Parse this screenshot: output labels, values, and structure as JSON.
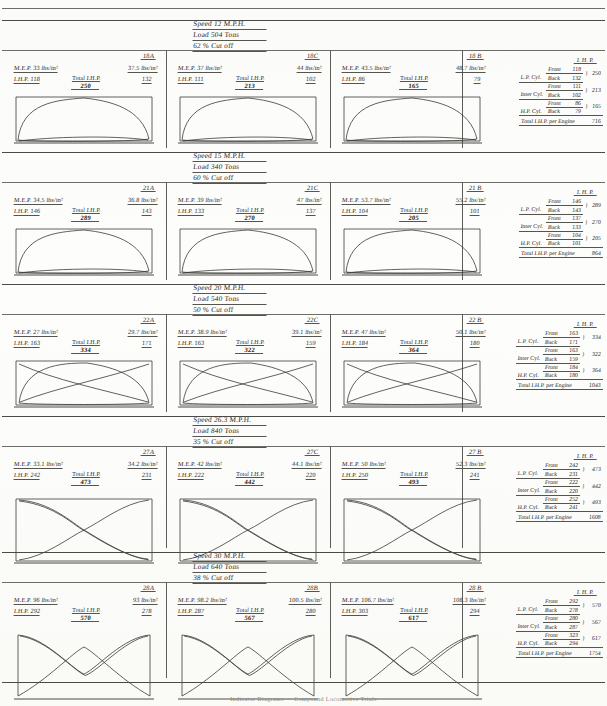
{
  "document": {
    "caption": "Indicator Diagrams — Compound Locomotive Trials",
    "ihp_header": "I. H. P.",
    "labels": {
      "mep": "M.E.P.",
      "ihp": "I.H.P.",
      "total_ihp": "Total I.H.P.",
      "front": "Front",
      "back": "Back",
      "total_per_engine": "Total I.H.P. per Engine",
      "lp_cyl": "L.P. Cyl.",
      "inter_cyl": "Inter Cyl.",
      "hp_cyl": "H.P. Cyl.",
      "units": "lbs/in²"
    },
    "colors": {
      "ink": "#2a2a28",
      "rule": "#55554f",
      "paper": "#fdfdfb"
    }
  },
  "sections": [
    {
      "id": "run-18",
      "speed": "Speed  12 M.P.H.",
      "load": "Load  504 Tons",
      "cutoff": "62 % Cut off",
      "panels": [
        {
          "fig": "18A",
          "mep_left": "M.E.P.  33 lbs/in²",
          "mep_right": "37.5 lbs/in²",
          "ihp_left": "I.H.P.  118",
          "ihp_right": "132",
          "total_ihp": "250",
          "shape": "loop"
        },
        {
          "fig": "18C",
          "mep_left": "M.E.P.  37 lbs/in²",
          "mep_right": "44 lbs/in²",
          "ihp_left": "I.H.P.  111",
          "ihp_right": "102",
          "total_ihp": "213",
          "shape": "loop"
        },
        {
          "fig": "18 B",
          "mep_left": "M.E.P.  43.5 lbs/in²",
          "mep_right": "48.7 lbs/in²",
          "ihp_left": "I.H.P.  86",
          "ihp_right": "79",
          "total_ihp": "165",
          "shape": "loop"
        }
      ],
      "table": {
        "rows": [
          {
            "cyl": "L.P. Cyl.",
            "front_label": "Front",
            "front": "118",
            "back_label": "Back",
            "back": "132",
            "total": "250"
          },
          {
            "cyl": "Inter Cyl.",
            "front_label": "Front",
            "front": "111",
            "back_label": "Back",
            "back": "102",
            "total": "213"
          },
          {
            "cyl": "H.P. Cyl.",
            "front_label": "Front",
            "front": "86",
            "back_label": "Back",
            "back": "79",
            "total": "165"
          }
        ],
        "total_label": "Total I.H.P. per Engine",
        "total_value": "716"
      }
    },
    {
      "id": "run-21",
      "speed": "Speed  15 M.P.H.",
      "load": "Load  340 Tons",
      "cutoff": "60 % Cut off",
      "panels": [
        {
          "fig": "21A",
          "mep_left": "M.E.P.  34.5 lbs/in²",
          "mep_right": "36.8 lbs/in²",
          "ihp_left": "I.H.P.  146",
          "ihp_right": "143",
          "total_ihp": "289",
          "shape": "loop"
        },
        {
          "fig": "21C",
          "mep_left": "M.E.P.  39 lbs/in²",
          "mep_right": "47 lbs/in²",
          "ihp_left": "I.H.P.  133",
          "ihp_right": "137",
          "total_ihp": "270",
          "shape": "loop"
        },
        {
          "fig": "21 B",
          "mep_left": "M.E.P.  53.7 lbs/in²",
          "mep_right": "55.2 lbs/in²",
          "ihp_left": "I.H.P.  104",
          "ihp_right": "101",
          "total_ihp": "205",
          "shape": "loop"
        }
      ],
      "table": {
        "rows": [
          {
            "cyl": "L.P. Cyl.",
            "front_label": "Front",
            "front": "146",
            "back_label": "Back",
            "back": "143",
            "total": "289"
          },
          {
            "cyl": "Inter Cyl.",
            "front_label": "Front",
            "front": "137",
            "back_label": "Back",
            "back": "133",
            "total": "270"
          },
          {
            "cyl": "H.P. Cyl.",
            "front_label": "Front",
            "front": "104",
            "back_label": "Back",
            "back": "101",
            "total": "205"
          }
        ],
        "total_label": "Total I.H.P. per Engine",
        "total_value": "864"
      }
    },
    {
      "id": "run-22",
      "speed": "Speed  20 M.P.H.",
      "load": "Load  540 Tons",
      "cutoff": "50 % Cut off",
      "panels": [
        {
          "fig": "22A",
          "mep_left": "M.E.P.  27 lbs/in²",
          "mep_right": "29.7 lbs/in²",
          "ihp_left": "I.H.P.  163",
          "ihp_right": "171",
          "total_ihp": "334",
          "shape": "cross"
        },
        {
          "fig": "22C",
          "mep_left": "M.E.P.  38.9 lbs/in²",
          "mep_right": "39.1 lbs/in²",
          "ihp_left": "I.H.P.  163",
          "ihp_right": "159",
          "total_ihp": "322",
          "shape": "cross"
        },
        {
          "fig": "22 B",
          "mep_left": "M.E.P.  47 lbs/in²",
          "mep_right": "50.1 lbs/in²",
          "ihp_left": "I.H.P.  184",
          "ihp_right": "180",
          "total_ihp": "364",
          "shape": "cross"
        }
      ],
      "table": {
        "rows": [
          {
            "cyl": "L.P. Cyl.",
            "front_label": "Front",
            "front": "163",
            "back_label": "Back",
            "back": "171",
            "total": "334"
          },
          {
            "cyl": "Inter Cyl.",
            "front_label": "Front",
            "front": "163",
            "back_label": "Back",
            "back": "159",
            "total": "322"
          },
          {
            "cyl": "H.P. Cyl.",
            "front_label": "Front",
            "front": "184",
            "back_label": "Back",
            "back": "180",
            "total": "364"
          }
        ],
        "total_label": "Total I.H.P. per Engine",
        "total_value": "1043"
      }
    },
    {
      "id": "run-27",
      "speed": "Speed  26.3 M.P.H.",
      "load": "Load  840 Tons",
      "cutoff": "35 % Cut off",
      "panels": [
        {
          "fig": "27A",
          "mep_left": "M.E.P.  33.1 lbs/in²",
          "mep_right": "34.2 lbs/in²",
          "ihp_left": "I.H.P.  242",
          "ihp_right": "231",
          "total_ihp": "473",
          "shape": "bowtie"
        },
        {
          "fig": "27C",
          "mep_left": "M.E.P.  42 lbs/in²",
          "mep_right": "44.1 lbs/in²",
          "ihp_left": "I.H.P.  222",
          "ihp_right": "220",
          "total_ihp": "442",
          "shape": "bowtie"
        },
        {
          "fig": "27 B",
          "mep_left": "M.E.P.  50 lbs/in²",
          "mep_right": "52.3 lbs/in²",
          "ihp_left": "I.H.P.  250",
          "ihp_right": "241",
          "total_ihp": "493",
          "shape": "bowtie"
        }
      ],
      "table": {
        "rows": [
          {
            "cyl": "L.P. Cyl.",
            "front_label": "Front",
            "front": "242",
            "back_label": "Back",
            "back": "231",
            "total": "473"
          },
          {
            "cyl": "Inter Cyl.",
            "front_label": "Front",
            "front": "222",
            "back_label": "Back",
            "back": "220",
            "total": "442"
          },
          {
            "cyl": "H.P. Cyl.",
            "front_label": "Front",
            "front": "252",
            "back_label": "Back",
            "back": "241",
            "total": "493"
          }
        ],
        "total_label": "Total I.H.P. per Engine",
        "total_value": "1608"
      }
    },
    {
      "id": "run-28",
      "speed": "Speed  30 M.P.H.",
      "load": "Load  640 Tons",
      "cutoff": "38 % Cut off",
      "panels": [
        {
          "fig": "28A",
          "mep_left": "M.E.P.  96 lbs/in²",
          "mep_right": "93 lbs/in²",
          "ihp_left": "I.H.P.  292",
          "ihp_right": "278",
          "total_ihp": "570",
          "shape": "bowtie2"
        },
        {
          "fig": "28B",
          "mep_left": "M.E.P.  98.2 lbs/in²",
          "mep_right": "100.5 lbs/in²",
          "ihp_left": "I.H.P.  287",
          "ihp_right": "280",
          "total_ihp": "567",
          "shape": "bowtie2"
        },
        {
          "fig": "28 B",
          "mep_left": "M.E.P.  106.7 lbs/in²",
          "mep_right": "108.3 lbs/in²",
          "ihp_left": "I.H.P.  303",
          "ihp_right": "294",
          "total_ihp": "617",
          "shape": "bowtie2"
        }
      ],
      "table": {
        "rows": [
          {
            "cyl": "L.P. Cyl.",
            "front_label": "Front",
            "front": "292",
            "back_label": "Back",
            "back": "278",
            "total": "570"
          },
          {
            "cyl": "Inter Cyl.",
            "front_label": "Front",
            "front": "280",
            "back_label": "Back",
            "back": "287",
            "total": "567"
          },
          {
            "cyl": "H.P. Cyl.",
            "front_label": "Front",
            "front": "323",
            "back_label": "Back",
            "back": "294",
            "total": "617"
          }
        ],
        "total_label": "Total I.H.P. per Engine",
        "total_value": "1754"
      }
    }
  ]
}
